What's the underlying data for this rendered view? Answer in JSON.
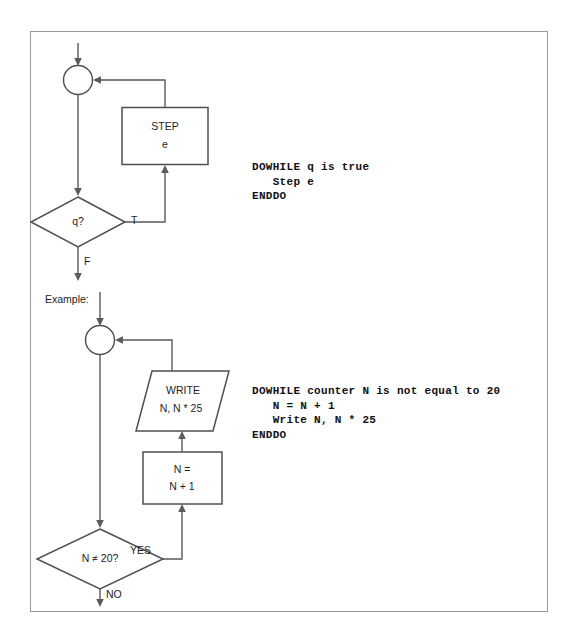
{
  "document": {
    "title": "DOWHILE loop flowchart and pseudocode",
    "background_color": "#ffffff",
    "frame_border_color": "#9a9a9a",
    "shape_stroke_color": "#4f4f4f",
    "connector_color": "#5a5a5a",
    "text_color": "#1d1d1d"
  },
  "generic_flowchart": {
    "label": "generic DOWHILE loop",
    "connector_circle": {
      "name": "loop-junction",
      "label": ""
    },
    "process_box": {
      "line1": "STEP",
      "line2": "e"
    },
    "decision": {
      "text": "q?",
      "true_label": "T",
      "false_label": "F"
    }
  },
  "generic_pseudocode": {
    "lines": [
      "DOWHILE q is true",
      "   Step e",
      "ENDDO"
    ],
    "text": "DOWHILE q is true\n   Step e\nENDDO"
  },
  "example": {
    "caption": "Example:",
    "connector_circle": {
      "name": "loop-junction",
      "label": ""
    },
    "output_shape": {
      "line1": "WRITE",
      "line2": "N, N * 25"
    },
    "process_box": {
      "line1": "N =",
      "line2": "N + 1"
    },
    "decision": {
      "text": "N ≠ 20?",
      "true_label": "YES",
      "false_label": "NO"
    }
  },
  "example_pseudocode": {
    "lines": [
      "DOWHILE counter N is not equal to 20",
      "   N = N + 1",
      "   Write N, N * 25",
      "ENDDO"
    ],
    "text": "DOWHILE counter N is not equal to 20\n   N = N + 1\n   Write N, N * 25\nENDDO"
  }
}
